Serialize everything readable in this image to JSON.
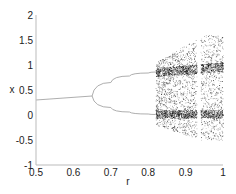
{
  "chart_data": {
    "type": "scatter",
    "title": "",
    "xlabel": "r",
    "ylabel": "x",
    "xlim": [
      0.5,
      1
    ],
    "ylim": [
      -1,
      2
    ],
    "xticks": [
      "0.5",
      "0.6",
      "0.7",
      "0.8",
      "0.9",
      "1"
    ],
    "xtick_values": [
      0.5,
      0.6,
      0.7,
      0.8,
      0.9,
      1
    ],
    "yticks": [
      "-1",
      "-0.5",
      "0",
      "0.5",
      "1",
      "1.5",
      "2"
    ],
    "ytick_values": [
      -1,
      -0.5,
      0,
      0.5,
      1,
      1.5,
      2
    ],
    "grid": false,
    "legend": null,
    "segments": {
      "fixed_point": {
        "r": [
          0.5,
          0.65
        ],
        "x": [
          0.3,
          0.38
        ]
      },
      "upper_branch": {
        "r": [
          0.65,
          0.7,
          0.75,
          0.8,
          0.82
        ],
        "x": [
          0.38,
          0.65,
          0.78,
          0.84,
          0.86
        ]
      },
      "lower_branch": {
        "r": [
          0.65,
          0.7,
          0.75,
          0.8,
          0.82
        ],
        "x": [
          0.38,
          0.15,
          0.06,
          0.02,
          0.01
        ]
      },
      "chaos_start_r": 0.82,
      "gap_r": [
        0.93,
        0.94
      ],
      "chaos_x_range": [
        -0.5,
        1.65
      ]
    },
    "color": "#000000"
  }
}
